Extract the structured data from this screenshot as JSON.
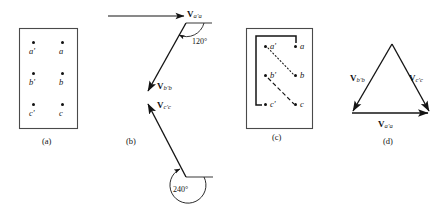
{
  "figure": {
    "panels": [
      {
        "id": "a",
        "caption": "(a)",
        "type": "conductor-box",
        "points": [
          {
            "label": "a'",
            "prime": true,
            "x": 33,
            "y": 43
          },
          {
            "label": "a",
            "prime": false,
            "x": 62,
            "y": 43
          },
          {
            "label": "b'",
            "prime": true,
            "x": 33,
            "y": 75
          },
          {
            "label": "b",
            "prime": false,
            "x": 62,
            "y": 75
          },
          {
            "label": "c'",
            "prime": true,
            "x": 33,
            "y": 105
          },
          {
            "label": "c",
            "prime": false,
            "x": 62,
            "y": 105
          }
        ],
        "box": {
          "x": 19,
          "y": 28,
          "w": 58,
          "h": 100
        }
      },
      {
        "id": "b",
        "caption": "(b)",
        "type": "vector-phasors",
        "vectors": [
          {
            "name": "V_a'a",
            "base": "V",
            "sub": "a'a",
            "direction": "right",
            "label_x": 187,
            "label_y": 10
          },
          {
            "name": "V_b'b",
            "base": "V",
            "sub": "b'b",
            "direction": "down-left",
            "label_x": 157,
            "label_y": 82
          },
          {
            "name": "V_c'c",
            "base": "V",
            "sub": "c'c",
            "direction": "up-left",
            "label_x": 157,
            "label_y": 101
          }
        ],
        "angles": [
          {
            "value": "120°",
            "label_x": 192,
            "label_y": 38
          },
          {
            "value": "240°",
            "label_x": 173,
            "label_y": 186
          }
        ]
      },
      {
        "id": "c",
        "caption": "(c)",
        "type": "wye-connection",
        "points": [
          {
            "label": "a'",
            "prime": true,
            "x": 265,
            "y": 47
          },
          {
            "label": "a",
            "prime": false,
            "x": 296,
            "y": 47
          },
          {
            "label": "b'",
            "prime": true,
            "x": 265,
            "y": 76
          },
          {
            "label": "b",
            "prime": false,
            "x": 296,
            "y": 76
          },
          {
            "label": "c'",
            "prime": true,
            "x": 265,
            "y": 105
          },
          {
            "label": "c",
            "prime": false,
            "x": 296,
            "y": 105
          }
        ],
        "box": {
          "x": 246,
          "y": 28,
          "w": 66,
          "h": 100
        },
        "connections": [
          {
            "from": "a",
            "to": "c'",
            "style": "solid-bracket"
          },
          {
            "from": "a'",
            "to": "b",
            "style": "dotted"
          },
          {
            "from": "b'",
            "to": "c",
            "style": "dashed"
          }
        ]
      },
      {
        "id": "d",
        "caption": "(d)",
        "type": "vector-triangle",
        "vectors": [
          {
            "name": "V_b'b",
            "base": "V",
            "sub": "b'b",
            "label_x": 350,
            "label_y": 74
          },
          {
            "name": "V_c'c",
            "base": "V",
            "sub": "c'c",
            "label_x": 409,
            "label_y": 74
          },
          {
            "name": "V_a'a",
            "base": "V",
            "sub": "a'a",
            "label_x": 378,
            "label_y": 120
          }
        ],
        "apex": {
          "x": 392,
          "y": 44
        },
        "left": {
          "x": 352,
          "y": 113
        },
        "right": {
          "x": 430,
          "y": 113
        }
      }
    ],
    "captions": [
      {
        "text": "(a)",
        "x": 42,
        "y": 137
      },
      {
        "text": "(b)",
        "x": 126,
        "y": 137
      },
      {
        "text": "(c)",
        "x": 272,
        "y": 133
      },
      {
        "text": "(d)",
        "x": 383,
        "y": 137
      }
    ],
    "colors": {
      "stroke": "#141414",
      "background": "#ffffff",
      "box_stroke": "#4a4a4a"
    }
  }
}
